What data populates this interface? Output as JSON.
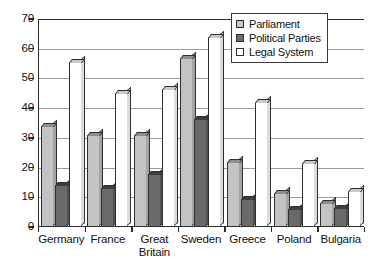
{
  "chart_data": {
    "type": "bar",
    "title": "",
    "subtitle": "",
    "xlabel": "",
    "ylabel": "",
    "ylim": [
      0,
      70
    ],
    "yticks": [
      0,
      10,
      20,
      30,
      40,
      50,
      60,
      70
    ],
    "grid": true,
    "legend_position": "top-right",
    "categories": [
      "Germany",
      "France",
      "Great Britain",
      "Sweden",
      "Greece",
      "Poland",
      "Bulgaria"
    ],
    "category_lines": [
      [
        "Germany"
      ],
      [
        "France"
      ],
      [
        "Great",
        "Britain"
      ],
      [
        "Sweden"
      ],
      [
        "Greece"
      ],
      [
        "Poland"
      ],
      [
        "Bulgaria"
      ]
    ],
    "series": [
      {
        "name": "Parliament",
        "color": "#c3c3c3",
        "values": [
          34,
          31,
          31,
          57,
          22,
          11.5,
          8
        ]
      },
      {
        "name": "Political Parties",
        "color": "#6a6a6a",
        "values": [
          14,
          13,
          18,
          36.5,
          9.5,
          6,
          6.5
        ]
      },
      {
        "name": "Legal System",
        "color": "#ffffff",
        "values": [
          55.5,
          45,
          46.5,
          64,
          42,
          21.5,
          12
        ]
      }
    ]
  },
  "legend": {
    "items": [
      {
        "label": "Parliament",
        "swatch": "legend-swatch-parliament"
      },
      {
        "label": "Political Parties",
        "swatch": "legend-swatch-political-parties"
      },
      {
        "label": "Legal System",
        "swatch": "legend-swatch-legal-system"
      }
    ]
  }
}
